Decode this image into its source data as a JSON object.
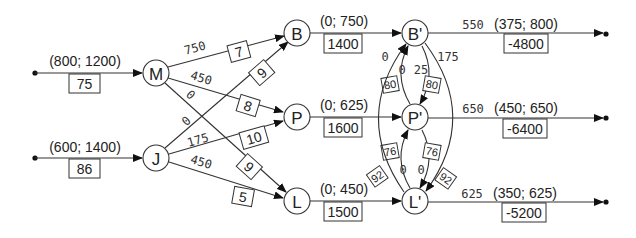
{
  "diagram": {
    "type": "network-flow",
    "sources": [
      {
        "id": "src-M",
        "to": "M",
        "bounds": "(800; 1200)",
        "cost": "75"
      },
      {
        "id": "src-J",
        "to": "J",
        "bounds": "(600; 1400)",
        "cost": "86"
      }
    ],
    "nodes": [
      {
        "id": "M",
        "label": "M"
      },
      {
        "id": "J",
        "label": "J"
      },
      {
        "id": "B",
        "label": "B"
      },
      {
        "id": "P",
        "label": "P"
      },
      {
        "id": "L",
        "label": "L"
      },
      {
        "id": "B2",
        "label": "B'"
      },
      {
        "id": "P2",
        "label": "P'"
      },
      {
        "id": "L2",
        "label": "L'"
      }
    ],
    "first_stage_edges": [
      {
        "from": "M",
        "to": "B",
        "flow": "750",
        "cost": "7"
      },
      {
        "from": "M",
        "to": "P",
        "flow": "450",
        "cost": "8"
      },
      {
        "from": "M",
        "to": "L",
        "flow": "0",
        "cost": "9"
      },
      {
        "from": "J",
        "to": "B",
        "flow": "0",
        "cost": "9"
      },
      {
        "from": "J",
        "to": "P",
        "flow": "175",
        "cost": "10"
      },
      {
        "from": "J",
        "to": "L",
        "flow": "450",
        "cost": "5"
      }
    ],
    "middle_edges": [
      {
        "from": "B",
        "to": "B2",
        "bounds": "(0; 750)",
        "cost": "1400"
      },
      {
        "from": "P",
        "to": "P2",
        "bounds": "(0; 625)",
        "cost": "1600"
      },
      {
        "from": "L",
        "to": "L2",
        "bounds": "(0; 450)",
        "cost": "1500"
      }
    ],
    "transfer_edges": [
      {
        "from": "P2",
        "to": "B2",
        "flow": "0",
        "cost": "80"
      },
      {
        "from": "B2",
        "to": "P2",
        "flow": "25",
        "cost": "80"
      },
      {
        "from": "L2",
        "to": "P2",
        "flow": "0",
        "cost": "76"
      },
      {
        "from": "P2",
        "to": "L2",
        "flow": "0",
        "cost": "76"
      },
      {
        "from": "L2",
        "to": "B2",
        "flow": "0",
        "cost": "92"
      },
      {
        "from": "B2",
        "to": "L2",
        "flow": "175",
        "cost": "92"
      }
    ],
    "sinks": [
      {
        "from": "B2",
        "flow": "550",
        "bounds": "(375; 800)",
        "cost": "-4800"
      },
      {
        "from": "P2",
        "flow": "650",
        "bounds": "(450; 650)",
        "cost": "-6400"
      },
      {
        "from": "L2",
        "flow": "625",
        "bounds": "(350; 625)",
        "cost": "-5200"
      }
    ]
  }
}
